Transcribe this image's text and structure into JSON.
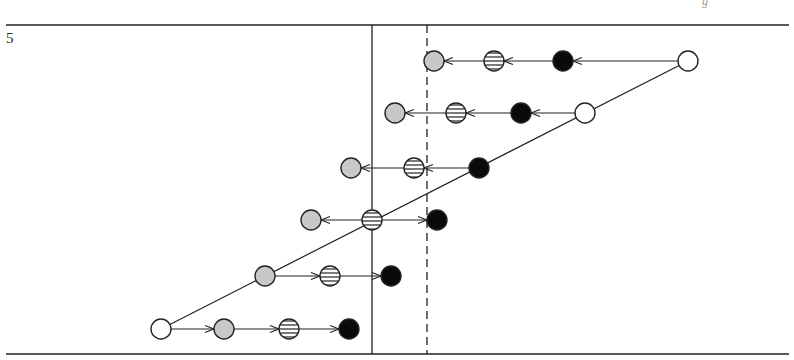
{
  "page": {
    "number": "5",
    "header_fragment": "g"
  },
  "diagram": {
    "top_rule_y": 25,
    "bottom_rule_y": 354,
    "rule_x": [
      6,
      789
    ],
    "solid_line": {
      "x": 372,
      "y1": 25,
      "y2": 354
    },
    "dashed_line": {
      "x": 427,
      "y1": 25,
      "y2": 354
    },
    "radius": 10,
    "colors": {
      "stroke": "#222222",
      "grey": "#c8c8c8",
      "black": "#0a0a0a",
      "white": "#ffffff",
      "stripe": "#333333"
    },
    "diagonal": [
      [
        161,
        329
      ],
      [
        688,
        61
      ]
    ],
    "nodes": [
      {
        "id": "r1-white",
        "type": "white",
        "x": 688,
        "y": 61
      },
      {
        "id": "r1-black",
        "type": "black",
        "x": 563,
        "y": 61
      },
      {
        "id": "r1-striped",
        "type": "striped",
        "x": 494,
        "y": 61
      },
      {
        "id": "r1-grey",
        "type": "grey",
        "x": 434,
        "y": 61
      },
      {
        "id": "r2-white",
        "type": "white",
        "x": 585,
        "y": 113
      },
      {
        "id": "r2-black",
        "type": "black",
        "x": 521,
        "y": 113
      },
      {
        "id": "r2-striped",
        "type": "striped",
        "x": 456,
        "y": 113
      },
      {
        "id": "r2-grey",
        "type": "grey",
        "x": 395,
        "y": 113
      },
      {
        "id": "r3-black",
        "type": "black",
        "x": 479,
        "y": 168
      },
      {
        "id": "r3-striped",
        "type": "striped",
        "x": 414,
        "y": 168
      },
      {
        "id": "r3-grey",
        "type": "grey",
        "x": 351,
        "y": 168
      },
      {
        "id": "r4-striped",
        "type": "striped",
        "x": 372,
        "y": 220
      },
      {
        "id": "r4-black",
        "type": "black",
        "x": 437,
        "y": 220
      },
      {
        "id": "r4-grey",
        "type": "grey",
        "x": 311,
        "y": 220
      },
      {
        "id": "r5-grey",
        "type": "grey",
        "x": 265,
        "y": 276
      },
      {
        "id": "r5-striped",
        "type": "striped",
        "x": 330,
        "y": 276
      },
      {
        "id": "r5-black",
        "type": "black",
        "x": 391,
        "y": 276
      },
      {
        "id": "r6-white",
        "type": "white",
        "x": 161,
        "y": 329
      },
      {
        "id": "r6-grey",
        "type": "grey",
        "x": 224,
        "y": 329
      },
      {
        "id": "r6-striped",
        "type": "striped",
        "x": 289,
        "y": 329
      },
      {
        "id": "r6-black",
        "type": "black",
        "x": 349,
        "y": 329
      }
    ],
    "arrows": [
      {
        "from": "r1-white",
        "to": "r1-black"
      },
      {
        "from": "r1-black",
        "to": "r1-striped"
      },
      {
        "from": "r1-striped",
        "to": "r1-grey"
      },
      {
        "from": "r2-white",
        "to": "r2-black"
      },
      {
        "from": "r2-black",
        "to": "r2-striped"
      },
      {
        "from": "r2-striped",
        "to": "r2-grey"
      },
      {
        "from": "r3-black",
        "to": "r3-striped"
      },
      {
        "from": "r3-striped",
        "to": "r3-grey"
      },
      {
        "from": "r4-striped",
        "to": "r4-grey"
      },
      {
        "from": "r4-striped",
        "to": "r4-black"
      },
      {
        "from": "r5-grey",
        "to": "r5-striped"
      },
      {
        "from": "r5-striped",
        "to": "r5-black"
      },
      {
        "from": "r6-white",
        "to": "r6-grey"
      },
      {
        "from": "r6-grey",
        "to": "r6-striped"
      },
      {
        "from": "r6-striped",
        "to": "r6-black"
      }
    ]
  }
}
